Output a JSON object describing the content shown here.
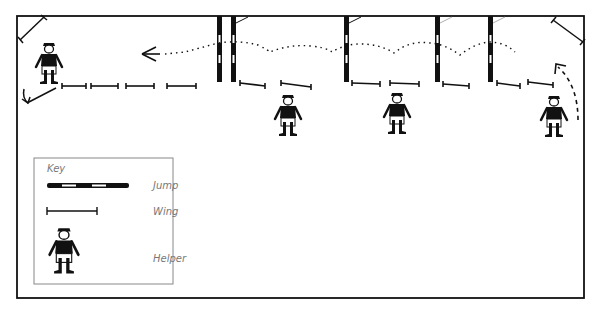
{
  "diagram": {
    "colors": {
      "ink": "#111111",
      "background": "#ffffff",
      "key_text": "#777777",
      "key_border": "#888888"
    },
    "arena": {
      "x": 17,
      "y": 16,
      "width": 567,
      "height": 282
    },
    "jumps": [
      {
        "id": "jump-1",
        "x": 219
      },
      {
        "id": "jump-2",
        "x": 233
      },
      {
        "id": "jump-3",
        "x": 346
      },
      {
        "id": "jump-4",
        "x": 437
      },
      {
        "id": "jump-5",
        "x": 490
      }
    ],
    "wings": [
      {
        "x1": 62,
        "y1": 86,
        "x2": 86,
        "y2": 86
      },
      {
        "x1": 91,
        "y1": 86,
        "x2": 118,
        "y2": 86
      },
      {
        "x1": 126,
        "y1": 86,
        "x2": 154,
        "y2": 86
      },
      {
        "x1": 167,
        "y1": 86,
        "x2": 196,
        "y2": 86
      },
      {
        "x1": 240,
        "y1": 83,
        "x2": 265,
        "y2": 86
      },
      {
        "x1": 281,
        "y1": 83,
        "x2": 311,
        "y2": 87
      },
      {
        "x1": 352,
        "y1": 83,
        "x2": 380,
        "y2": 84
      },
      {
        "x1": 390,
        "y1": 83,
        "x2": 419,
        "y2": 84
      },
      {
        "x1": 443,
        "y1": 84,
        "x2": 469,
        "y2": 86
      },
      {
        "x1": 497,
        "y1": 83,
        "x2": 520,
        "y2": 86
      },
      {
        "x1": 528,
        "y1": 82,
        "x2": 553,
        "y2": 85
      }
    ],
    "corner_wings": [
      {
        "x1": 20,
        "y1": 40,
        "x2": 44,
        "y2": 17
      },
      {
        "x1": 553,
        "y1": 20,
        "x2": 583,
        "y2": 42
      }
    ],
    "helpers": [
      {
        "id": "helper-1",
        "x": 49,
        "y": 43
      },
      {
        "id": "helper-2",
        "x": 288,
        "y": 95
      },
      {
        "id": "helper-3",
        "x": 397,
        "y": 93
      },
      {
        "id": "helper-4",
        "x": 554,
        "y": 96
      }
    ],
    "key": {
      "heading": "Key",
      "items": [
        {
          "symbol": "jump",
          "label": "Jump"
        },
        {
          "symbol": "wing",
          "label": "Wing"
        },
        {
          "symbol": "helper",
          "label": "Helper"
        }
      ]
    }
  }
}
